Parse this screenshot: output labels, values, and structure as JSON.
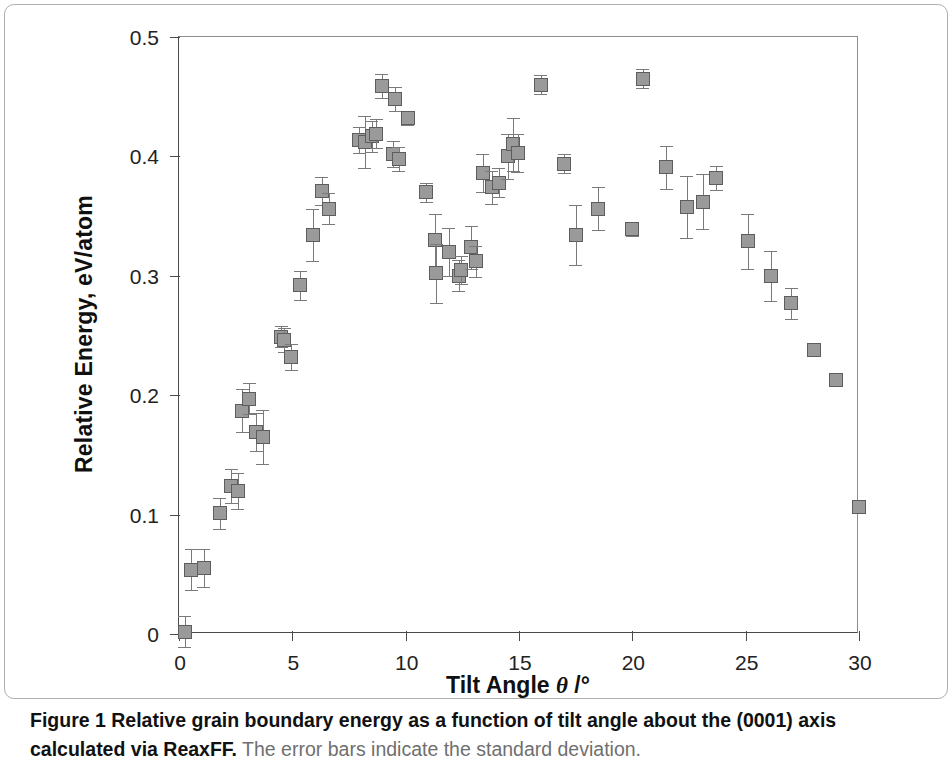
{
  "figure": {
    "caption_bold": "Figure 1 Relative grain boundary energy as a function of tilt angle about the (0001) axis calculated via ReaxFF.",
    "caption_rest": " The error bars indicate the standard deviation."
  },
  "chart_data": {
    "type": "scatter",
    "title": "",
    "xlabel": "Tilt Angle θ /°",
    "ylabel": "Relative Energy, eV/atom",
    "xlim": [
      0,
      30
    ],
    "ylim": [
      0,
      0.5
    ],
    "xticks": [
      0,
      5,
      10,
      15,
      20,
      25,
      30
    ],
    "yticks": [
      0,
      0.1,
      0.2,
      0.3,
      0.4,
      0.5
    ],
    "xticklabels": [
      "0",
      "5",
      "10",
      "15",
      "20",
      "25",
      "30"
    ],
    "yticklabels": [
      "0",
      "0.1",
      "0.2",
      "0.3",
      "0.4",
      "0.5"
    ],
    "grid": false,
    "legend": null,
    "marker": "square",
    "marker_color": "#9a9a9a",
    "marker_edge_color": "#5d5d5d",
    "errorbar_color": "#7a7a7a",
    "series": [
      {
        "name": "Relative grain boundary energy",
        "points": [
          {
            "x": 0.25,
            "y": 0.002,
            "err": 0.013
          },
          {
            "x": 0.55,
            "y": 0.054,
            "err": 0.017
          },
          {
            "x": 1.1,
            "y": 0.055,
            "err": 0.016
          },
          {
            "x": 1.8,
            "y": 0.101,
            "err": 0.013
          },
          {
            "x": 2.3,
            "y": 0.124,
            "err": 0.014
          },
          {
            "x": 2.6,
            "y": 0.12,
            "err": 0.015
          },
          {
            "x": 2.8,
            "y": 0.187,
            "err": 0.018
          },
          {
            "x": 3.1,
            "y": 0.197,
            "err": 0.013
          },
          {
            "x": 3.4,
            "y": 0.169,
            "err": 0.016
          },
          {
            "x": 3.7,
            "y": 0.165,
            "err": 0.023
          },
          {
            "x": 4.5,
            "y": 0.249,
            "err": 0.009
          },
          {
            "x": 4.65,
            "y": 0.246,
            "err": 0.01
          },
          {
            "x": 4.95,
            "y": 0.232,
            "err": 0.011
          },
          {
            "x": 5.35,
            "y": 0.292,
            "err": 0.012
          },
          {
            "x": 5.9,
            "y": 0.334,
            "err": 0.022
          },
          {
            "x": 6.3,
            "y": 0.371,
            "err": 0.012
          },
          {
            "x": 6.6,
            "y": 0.356,
            "err": 0.013
          },
          {
            "x": 7.95,
            "y": 0.414,
            "err": 0.011
          },
          {
            "x": 8.2,
            "y": 0.412,
            "err": 0.022
          },
          {
            "x": 8.5,
            "y": 0.417,
            "err": 0.013
          },
          {
            "x": 8.7,
            "y": 0.419,
            "err": 0.012
          },
          {
            "x": 8.95,
            "y": 0.459,
            "err": 0.01
          },
          {
            "x": 9.55,
            "y": 0.448,
            "err": 0.01
          },
          {
            "x": 9.45,
            "y": 0.402,
            "err": 0.011
          },
          {
            "x": 9.7,
            "y": 0.398,
            "err": 0.01
          },
          {
            "x": 10.1,
            "y": 0.432,
            "err": 0.006
          },
          {
            "x": 10.9,
            "y": 0.37,
            "err": 0.008
          },
          {
            "x": 11.3,
            "y": 0.33,
            "err": 0.022
          },
          {
            "x": 11.35,
            "y": 0.302,
            "err": 0.025
          },
          {
            "x": 11.9,
            "y": 0.32,
            "err": 0.02
          },
          {
            "x": 12.35,
            "y": 0.3,
            "err": 0.013
          },
          {
            "x": 12.45,
            "y": 0.305,
            "err": 0.012
          },
          {
            "x": 12.9,
            "y": 0.324,
            "err": 0.018
          },
          {
            "x": 13.1,
            "y": 0.312,
            "err": 0.013
          },
          {
            "x": 13.4,
            "y": 0.386,
            "err": 0.016
          },
          {
            "x": 13.8,
            "y": 0.374,
            "err": 0.014
          },
          {
            "x": 14.1,
            "y": 0.378,
            "err": 0.012
          },
          {
            "x": 14.5,
            "y": 0.4,
            "err": 0.019
          },
          {
            "x": 14.75,
            "y": 0.41,
            "err": 0.022
          },
          {
            "x": 14.95,
            "y": 0.403,
            "err": 0.016
          },
          {
            "x": 15.95,
            "y": 0.46,
            "err": 0.008
          },
          {
            "x": 17.0,
            "y": 0.394,
            "err": 0.008
          },
          {
            "x": 17.5,
            "y": 0.334,
            "err": 0.025
          },
          {
            "x": 18.5,
            "y": 0.356,
            "err": 0.018
          },
          {
            "x": 20.0,
            "y": 0.339,
            "err": 0.006
          },
          {
            "x": 20.45,
            "y": 0.465,
            "err": 0.008
          },
          {
            "x": 21.5,
            "y": 0.391,
            "err": 0.018
          },
          {
            "x": 22.4,
            "y": 0.358,
            "err": 0.026
          },
          {
            "x": 23.1,
            "y": 0.362,
            "err": 0.023
          },
          {
            "x": 23.7,
            "y": 0.382,
            "err": 0.01
          },
          {
            "x": 25.1,
            "y": 0.329,
            "err": 0.023
          },
          {
            "x": 26.1,
            "y": 0.3,
            "err": 0.021
          },
          {
            "x": 27.0,
            "y": 0.277,
            "err": 0.013
          },
          {
            "x": 28.0,
            "y": 0.238,
            "err": 0.0
          },
          {
            "x": 29.0,
            "y": 0.213,
            "err": 0.0
          },
          {
            "x": 30.0,
            "y": 0.106,
            "err": 0.0
          }
        ]
      }
    ]
  }
}
